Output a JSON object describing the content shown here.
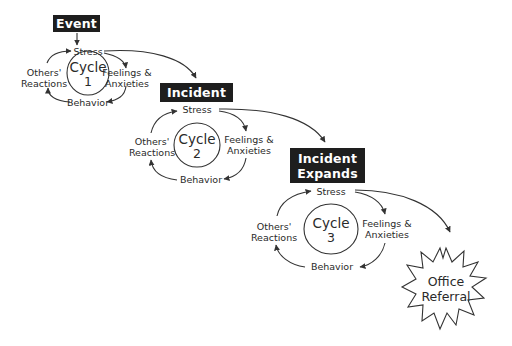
{
  "diagram": {
    "stages": [
      {
        "id": "event",
        "label": "Event"
      },
      {
        "id": "incident",
        "label": "Incident"
      },
      {
        "id": "incident-expands",
        "label_line1": "Incident",
        "label_line2": "Expands"
      }
    ],
    "cycles": [
      {
        "cycle_label": "Cycle",
        "cycle_number": "1",
        "stress": "Stress",
        "feelings_line1": "Feelings &",
        "feelings_line2": "Anxieties",
        "behavior": "Behavior",
        "others_line1": "Others'",
        "others_line2": "Reactions"
      },
      {
        "cycle_label": "Cycle",
        "cycle_number": "2",
        "stress": "Stress",
        "feelings_line1": "Feelings &",
        "feelings_line2": "Anxieties",
        "behavior": "Behavior",
        "others_line1": "Others'",
        "others_line2": "Reactions"
      },
      {
        "cycle_label": "Cycle",
        "cycle_number": "3",
        "stress": "Stress",
        "feelings_line1": "Feelings &",
        "feelings_line2": "Anxieties",
        "behavior": "Behavior",
        "others_line1": "Others'",
        "others_line2": "Reactions"
      }
    ],
    "outcome": {
      "label_line1": "Office",
      "label_line2": "Referral"
    },
    "colors": {
      "box_fill": "#1e1e1e",
      "box_text": "#ffffff",
      "line": "#333333",
      "background": "#ffffff"
    }
  }
}
